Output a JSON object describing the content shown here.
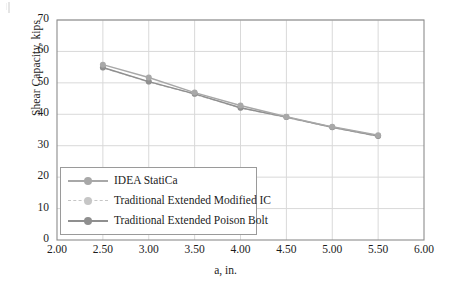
{
  "chart_data": {
    "type": "line",
    "title": "",
    "xlabel": "a, in.",
    "ylabel": "Shear Capacity, kips",
    "xlim": [
      2.0,
      6.0
    ],
    "ylim": [
      0,
      70
    ],
    "xticks": [
      "2.00",
      "2.50",
      "3.00",
      "3.50",
      "4.00",
      "4.50",
      "5.00",
      "5.50",
      "6.00"
    ],
    "yticks": [
      "0",
      "10",
      "20",
      "30",
      "40",
      "50",
      "60",
      "70"
    ],
    "grid": true,
    "legend_position": "lower left inside",
    "x": [
      2.5,
      3.0,
      3.5,
      4.0,
      4.5,
      5.0,
      5.5
    ],
    "series": [
      {
        "name": "IDEA StatiCa",
        "color": "#a8a8a8",
        "style": "solid",
        "marker": "circle",
        "values": [
          55.8,
          51.7,
          46.9,
          42.8,
          39.2,
          36.0,
          33.3
        ]
      },
      {
        "name": "Traditional Extended Modified IC",
        "color": "#c6c6c6",
        "style": "dashed",
        "marker": "circle",
        "values": [
          54.8,
          50.3,
          46.4,
          42.0,
          39.0,
          35.8,
          33.0
        ]
      },
      {
        "name": "Traditional Extended Poison Bolt",
        "color": "#8f8f8f",
        "style": "solid",
        "marker": "circle",
        "values": [
          54.9,
          50.4,
          46.5,
          42.1,
          39.1,
          35.9,
          33.1
        ]
      }
    ]
  },
  "axes": {
    "frame_color": "#8c8c8c",
    "grid_color": "#d9d9d9"
  }
}
